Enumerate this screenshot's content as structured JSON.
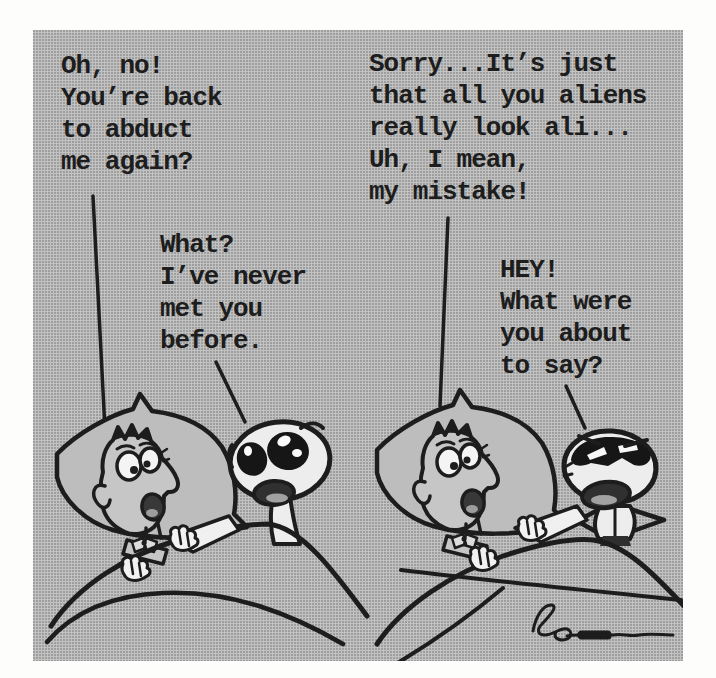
{
  "panel": {
    "background": "#b9b9b9",
    "ink": "#1d1d1d",
    "human_skin": "#c6c6c6",
    "alien_skin": "#ededed",
    "highlight_white": "#f2f2f2"
  },
  "comic": {
    "scenes": [
      {
        "name": "first-abduction-scene",
        "human_speech": "Oh, no!\nYou’re back\nto abduct\nme again?",
        "alien_speech": "What?\nI’ve never\nmet you\nbefore."
      },
      {
        "name": "second-abduction-scene",
        "human_speech": "Sorry...It’s just\nthat all you aliens\nreally look ali...\nUh, I mean,\nmy mistake!",
        "alien_speech": "HEY!\nWhat were\nyou about\nto say?"
      }
    ]
  }
}
